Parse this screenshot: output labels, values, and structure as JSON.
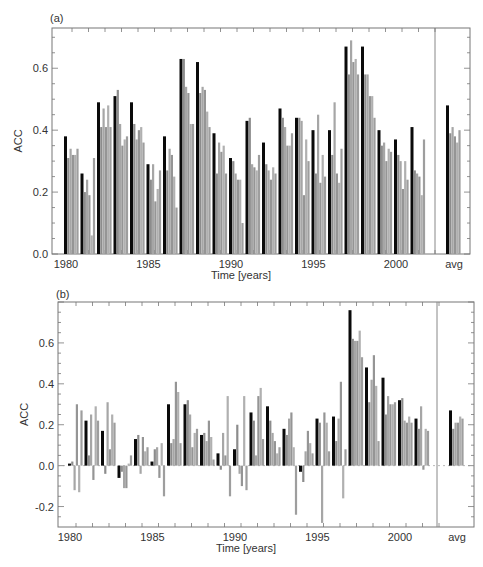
{
  "chart_data": [
    {
      "type": "bar",
      "panel_label": "(a)",
      "title": "",
      "xlabel": "Time [years]",
      "ylabel": "ACC",
      "ylim": [
        0.0,
        0.73
      ],
      "yticks": [
        0.0,
        0.2,
        0.4,
        0.6
      ],
      "ytick_labels": [
        "0.0",
        "0.2",
        "0.4",
        "0.6"
      ],
      "xtick_labels": [
        "1980",
        "1985",
        "1990",
        "1995",
        "2000",
        "avg"
      ],
      "grid": false,
      "legend": "none",
      "series_note": "Each group: first bar (black) = reference forecast, following bars (gray) = other forecasts",
      "categories": [
        "1980",
        "1981",
        "1982",
        "1983",
        "1984",
        "1985",
        "1986",
        "1987",
        "1988",
        "1989",
        "1990",
        "1991",
        "1992",
        "1993",
        "1994",
        "1995",
        "1996",
        "1997",
        "1998",
        "1999",
        "2000",
        "2001",
        "avg"
      ],
      "series": [
        {
          "name": "black",
          "color": "#0a0a0a",
          "values": [
            0.38,
            0.26,
            0.49,
            0.51,
            0.49,
            0.29,
            0.38,
            0.63,
            0.62,
            0.39,
            0.31,
            0.43,
            0.36,
            0.47,
            0.44,
            0.4,
            0.4,
            0.67,
            0.67,
            0.4,
            0.37,
            0.41,
            0.48
          ]
        },
        {
          "name": "gray1",
          "color": "#8c8c8c",
          "values": [
            0.31,
            0.2,
            0.41,
            0.53,
            0.42,
            0.24,
            0.27,
            0.63,
            0.52,
            0.26,
            0.3,
            0.44,
            0.29,
            0.44,
            0.44,
            0.26,
            0.32,
            0.58,
            0.58,
            0.35,
            0.32,
            0.27,
            0.39
          ]
        },
        {
          "name": "gray2",
          "color": "#a6a6a6",
          "values": [
            0.34,
            0.24,
            0.47,
            0.42,
            0.37,
            0.29,
            0.34,
            0.54,
            0.54,
            0.36,
            0.26,
            0.29,
            0.27,
            0.41,
            0.43,
            0.45,
            0.49,
            0.69,
            0.58,
            0.36,
            0.3,
            0.26,
            0.41
          ]
        },
        {
          "name": "gray3",
          "color": "#959595",
          "values": [
            0.32,
            0.19,
            0.41,
            0.35,
            0.4,
            0.17,
            0.32,
            0.52,
            0.53,
            0.33,
            0.24,
            0.28,
            0.24,
            0.35,
            0.19,
            0.23,
            0.26,
            0.62,
            0.51,
            0.3,
            0.21,
            0.25,
            0.38
          ]
        },
        {
          "name": "gray4",
          "color": "#b0b0b0",
          "values": [
            0.32,
            0.06,
            0.48,
            0.37,
            0.41,
            0.21,
            0.25,
            0.42,
            0.46,
            0.35,
            0.24,
            0.27,
            0.28,
            0.35,
            0.37,
            0.32,
            0.23,
            0.63,
            0.51,
            0.34,
            0.3,
            0.19,
            0.36
          ]
        },
        {
          "name": "gray5",
          "color": "#9e9e9e",
          "values": [
            0.34,
            0.31,
            0.41,
            0.38,
            0.36,
            0.27,
            0.15,
            0.42,
            0.41,
            0.26,
            0.1,
            0.32,
            0.26,
            0.39,
            0.3,
            0.25,
            0.34,
            0.58,
            0.44,
            0.33,
            0.24,
            0.37,
            0.4
          ]
        }
      ]
    },
    {
      "type": "bar",
      "panel_label": "(b)",
      "title": "",
      "xlabel": "Time [years]",
      "ylabel": "ACC",
      "ylim": [
        -0.3,
        0.8
      ],
      "yticks": [
        -0.2,
        0.0,
        0.2,
        0.4,
        0.6
      ],
      "ytick_labels": [
        "-0.2",
        "0.0",
        "0.2",
        "0.4",
        "0.6"
      ],
      "xtick_labels": [
        "1980",
        "1985",
        "1990",
        "1995",
        "2000",
        "avg"
      ],
      "grid": false,
      "legend": "none",
      "series_note": "Each group: first bar (black) = reference forecast, following bars (gray) = other forecasts",
      "categories": [
        "1980",
        "1981",
        "1982",
        "1983",
        "1984",
        "1985",
        "1986",
        "1987",
        "1988",
        "1989",
        "1990",
        "1991",
        "1992",
        "1993",
        "1994",
        "1995",
        "1996",
        "1997",
        "1998",
        "1999",
        "2000",
        "2001",
        "avg"
      ],
      "series": [
        {
          "name": "black",
          "color": "#0a0a0a",
          "values": [
            0.01,
            0.22,
            0.17,
            -0.06,
            0.13,
            0.02,
            0.3,
            0.3,
            0.15,
            0.06,
            0.08,
            0.26,
            0.29,
            0.18,
            -0.03,
            0.23,
            0.24,
            0.76,
            0.48,
            0.43,
            0.32,
            0.23,
            0.27
          ]
        },
        {
          "name": "gray1",
          "color": "#8c8c8c",
          "values": [
            0.02,
            0.05,
            -0.04,
            -0.03,
            0.15,
            0.08,
            0.11,
            0.32,
            0.16,
            -0.02,
            0.2,
            0.22,
            0.22,
            0.15,
            -0.08,
            0.21,
            0.12,
            0.62,
            0.31,
            0.25,
            0.33,
            0.18,
            0.18
          ]
        },
        {
          "name": "gray2",
          "color": "#a6a6a6",
          "values": [
            -0.12,
            0.25,
            0.31,
            -0.11,
            -0.04,
            0.09,
            0.13,
            0.25,
            0.12,
            0.16,
            -0.04,
            0.05,
            0.16,
            0.23,
            0.07,
            -0.28,
            0.23,
            0.61,
            0.42,
            0.34,
            0.22,
            0.29,
            0.21
          ]
        },
        {
          "name": "gray3",
          "color": "#959595",
          "values": [
            0.3,
            -0.07,
            0.08,
            -0.11,
            0.14,
            -0.06,
            0.41,
            0.09,
            0.22,
            0.05,
            -0.1,
            0.34,
            0.12,
            0.26,
            0.17,
            0.26,
            0.41,
            0.61,
            0.54,
            0.3,
            0.21,
            -0.02,
            0.21
          ]
        },
        {
          "name": "gray4",
          "color": "#b0b0b0",
          "values": [
            -0.13,
            0.29,
            0.25,
            0.01,
            0.07,
            0.11,
            0.36,
            0.16,
            0.14,
            0.34,
            0.34,
            0.38,
            0.06,
            0.09,
            0.11,
            0.21,
            -0.16,
            0.66,
            0.39,
            0.3,
            0.24,
            0.18,
            0.24
          ]
        },
        {
          "name": "gray5",
          "color": "#9e9e9e",
          "values": [
            0.27,
            0.22,
            0.21,
            0.05,
            0.09,
            -0.15,
            0.11,
            0.18,
            0.03,
            -0.15,
            -0.12,
            0.13,
            0.09,
            -0.24,
            0.06,
            0.07,
            0.08,
            0.53,
            0.12,
            0.31,
            0.21,
            0.17,
            0.23
          ]
        }
      ]
    }
  ],
  "panels": [
    {
      "label": "(a)",
      "ylabel": "ACC",
      "xlabel": "Time [years]"
    },
    {
      "label": "(b)",
      "ylabel": "ACC",
      "xlabel": "Time [years]"
    }
  ],
  "caption_fragment": "...anomaly correlation coefficient for..."
}
